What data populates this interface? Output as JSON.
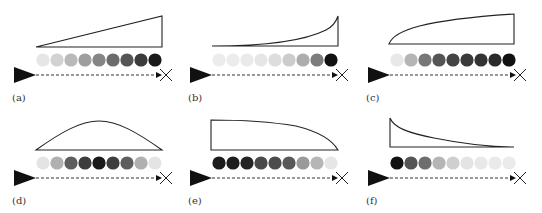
{
  "figure": {
    "panels": [
      {
        "id": "a",
        "label": "(a)",
        "profile": "linear-increasing",
        "origin": [
          0,
          0
        ],
        "shape_path": "M36,47 L162,16 L162,47 Z",
        "circle_shades": [
          "#e6e6e6",
          "#d2d2d2",
          "#b9b9b9",
          "#9e9e9e",
          "#858585",
          "#6c6c6c",
          "#555555",
          "#3c3c3c",
          "#1a1a1a"
        ]
      },
      {
        "id": "b",
        "label": "(b)",
        "profile": "exponential-increasing",
        "origin": [
          176,
          0
        ],
        "shape_path": "M36,46 C90,46 130,40 150,30 C156,27 160,22 162,16 L162,46 Z",
        "circle_shades": [
          "#ececec",
          "#ececec",
          "#eaeaea",
          "#e6e6e6",
          "#dddddd",
          "#cccccc",
          "#adadad",
          "#7c7c7c",
          "#111111"
        ]
      },
      {
        "id": "c",
        "label": "(c)",
        "profile": "saturating-increasing",
        "origin": [
          354,
          0
        ],
        "shape_path": "M35,44 C40,30 70,20 160,14 L160,44 Z",
        "circle_shades": [
          "#e8e8e8",
          "#b5b5b5",
          "#777777",
          "#555555",
          "#444444",
          "#3a3a3a",
          "#333333",
          "#2a2a2a",
          "#111111"
        ]
      },
      {
        "id": "d",
        "label": "(d)",
        "profile": "bell-shaped",
        "origin": [
          0,
          103
        ],
        "shape_path": "M36,47 C60,30 80,18 99,18 C118,18 138,30 162,47 Z",
        "circle_shades": [
          "#e4e4e4",
          "#b0b0b0",
          "#5e5e5e",
          "#3d3d3d",
          "#1a1a1a",
          "#3d3d3d",
          "#5e5e5e",
          "#b0b0b0",
          "#e4e4e4"
        ]
      },
      {
        "id": "e",
        "label": "(e)",
        "profile": "decreasing-convex",
        "origin": [
          176,
          103
        ],
        "shape_path": "M35,17 L35,47 L162,47 C155,35 140,28 120,23 C90,18 60,17 35,17 Z",
        "circle_shades": [
          "#1c1c1c",
          "#1e1e1e",
          "#242424",
          "#4a4a4a",
          "#4c4c4c",
          "#595959",
          "#9a9a9a",
          "#b6b6b6",
          "#e6e6e6"
        ]
      },
      {
        "id": "f",
        "label": "(f)",
        "profile": "exponential-decay",
        "origin": [
          354,
          103
        ],
        "shape_path": "M36,15 C40,25 55,30 80,35 C110,41 140,44 160,44 L36,44 Z",
        "circle_shades": [
          "#111111",
          "#555555",
          "#6e6e6e",
          "#b5b5b5",
          "#cfcfcf",
          "#e4e4e4",
          "#e8e8e8",
          "#eaeaea",
          "#ebebeb"
        ]
      }
    ],
    "colors": {
      "stroke": "#222222",
      "arrow": "#111111",
      "dash": "#333333",
      "label": "#333333"
    }
  }
}
